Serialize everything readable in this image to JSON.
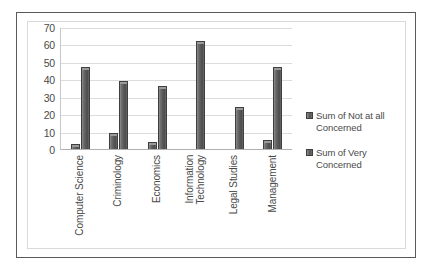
{
  "chart_data": {
    "type": "bar",
    "title": "",
    "xlabel": "",
    "ylabel": "",
    "ylim": [
      0,
      70
    ],
    "ytick_step": 10,
    "yticks": [
      70,
      60,
      50,
      40,
      30,
      20,
      10,
      0
    ],
    "grid": true,
    "legend_position": "right",
    "categories": [
      "Computer Science",
      "Criminology",
      "Economics",
      "Information Technology",
      "Legal Studies",
      "Management"
    ],
    "category_lines": [
      [
        "Computer Science"
      ],
      [
        "Criminology"
      ],
      [
        "Economics"
      ],
      [
        "Information",
        "Technology"
      ],
      [
        "Legal Studies"
      ],
      [
        "Management"
      ]
    ],
    "series": [
      {
        "name": "Sum of Not at all Concerned",
        "color": "#5a5a5a",
        "values": [
          3,
          9,
          4,
          0,
          0,
          5
        ]
      },
      {
        "name": "Sum of Very Concerned",
        "color": "#5a5a5a",
        "values": [
          47,
          39,
          36,
          62,
          24,
          47
        ]
      }
    ]
  },
  "legend": {
    "items": [
      {
        "label_line1": "Sum of Not at all",
        "label_line2": "Concerned"
      },
      {
        "label_line1": "Sum of Very",
        "label_line2": "Concerned"
      }
    ]
  },
  "caption": {
    "text": ""
  }
}
